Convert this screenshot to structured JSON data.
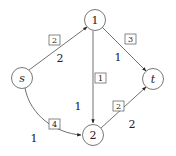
{
  "diagram": {
    "type": "flow-network",
    "nodes": [
      {
        "id": "s",
        "label": "s",
        "italic": true,
        "x": 22,
        "y": 78
      },
      {
        "id": "1",
        "label": "1",
        "italic": false,
        "x": 95,
        "y": 20
      },
      {
        "id": "t",
        "label": "t",
        "italic": true,
        "x": 153,
        "y": 79
      },
      {
        "id": "2",
        "label": "2",
        "italic": false,
        "x": 93,
        "y": 135
      }
    ],
    "edges": [
      {
        "from": "s",
        "to": "1",
        "capacity": "2",
        "boxed": "2"
      },
      {
        "from": "1",
        "to": "t",
        "capacity": "1",
        "boxed": "3"
      },
      {
        "from": "1",
        "to": "2",
        "capacity": "1",
        "boxed": "1"
      },
      {
        "from": "s",
        "to": "2",
        "capacity": "1",
        "boxed": "4"
      },
      {
        "from": "2",
        "to": "t",
        "capacity": "2",
        "boxed": "2"
      }
    ]
  },
  "labels": {
    "node_s": "s",
    "node_1": "1",
    "node_t": "t",
    "node_2": "2",
    "edge_s1_cap": "2",
    "edge_s1_box": "2",
    "edge_1t_cap": "1",
    "edge_1t_box": "3",
    "edge_12_cap": "1",
    "edge_12_box": "1",
    "edge_s2_cap": "1",
    "edge_s2_box": "4",
    "edge_2t_cap": "2",
    "edge_2t_box": "2"
  }
}
